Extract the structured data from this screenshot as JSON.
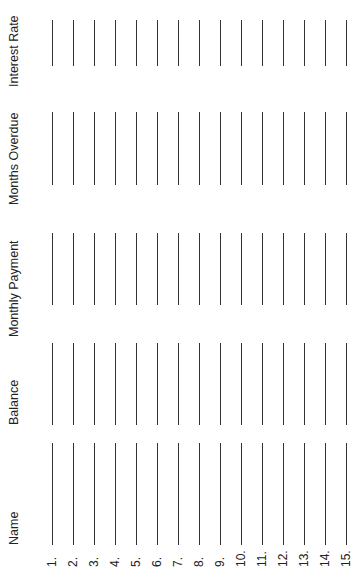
{
  "form": {
    "headers": {
      "name": "Name",
      "balance": "Balance",
      "monthly_payment": "Monthly Payment",
      "months_overdue": "Months Overdue",
      "interest_rate": "Interest Rate"
    },
    "rows": [
      {
        "number": "1."
      },
      {
        "number": "2."
      },
      {
        "number": "3."
      },
      {
        "number": "4."
      },
      {
        "number": "5."
      },
      {
        "number": "6."
      },
      {
        "number": "7."
      },
      {
        "number": "8."
      },
      {
        "number": "9."
      },
      {
        "number": "10."
      },
      {
        "number": "11."
      },
      {
        "number": "12."
      },
      {
        "number": "13."
      },
      {
        "number": "14."
      },
      {
        "number": "15."
      }
    ],
    "line_color": "#333333",
    "orientation": "rotated -90deg"
  }
}
